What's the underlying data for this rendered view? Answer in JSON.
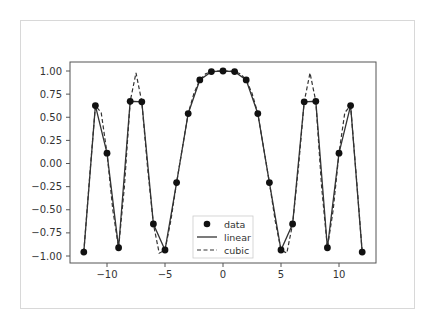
{
  "chart_data": {
    "type": "line",
    "title": "",
    "xlabel": "",
    "ylabel": "",
    "xlim": [
      -13.2,
      13.2
    ],
    "ylim": [
      -1.1,
      1.1
    ],
    "grid": false,
    "legend_position": "lower center",
    "x": [
      -12,
      -11,
      -10,
      -9,
      -8,
      -7,
      -6,
      -5,
      -4,
      -3,
      -2,
      -1,
      0,
      1,
      2,
      3,
      4,
      5,
      6,
      7,
      8,
      9,
      10,
      11,
      12
    ],
    "series": [
      {
        "name": "data",
        "style": "markers",
        "color": "#111111",
        "values": [
          -0.958,
          0.626,
          0.112,
          -0.911,
          0.672,
          0.667,
          -0.654,
          -0.935,
          -0.206,
          0.54,
          0.903,
          0.994,
          1.0,
          0.994,
          0.903,
          0.54,
          -0.206,
          -0.935,
          -0.654,
          0.667,
          0.672,
          -0.911,
          0.112,
          0.626,
          -0.958
        ]
      },
      {
        "name": "linear",
        "style": "solid",
        "color": "#333333",
        "values": [
          -0.958,
          0.626,
          0.112,
          -0.911,
          0.672,
          0.667,
          -0.654,
          -0.935,
          -0.206,
          0.54,
          0.903,
          0.994,
          1.0,
          0.994,
          0.903,
          0.54,
          -0.206,
          -0.935,
          -0.654,
          0.667,
          0.672,
          -0.911,
          0.112,
          0.626,
          -0.958
        ]
      },
      {
        "name": "cubic",
        "style": "dashed",
        "color": "#333333",
        "x": [
          -12,
          -11.5,
          -11,
          -10.5,
          -10,
          -9.5,
          -9,
          -8.5,
          -8,
          -7.5,
          -7,
          -6.5,
          -6,
          -5.5,
          -5,
          -4.5,
          -4,
          -3.5,
          -3,
          -2.5,
          -2,
          -1.5,
          -1,
          -0.5,
          0,
          0.5,
          1,
          1.5,
          2,
          2.5,
          3,
          3.5,
          4,
          4.5,
          5,
          5.5,
          6,
          6.5,
          7,
          7.5,
          8,
          8.5,
          9,
          9.5,
          10,
          10.5,
          11,
          11.5,
          12
        ],
        "values": [
          -0.958,
          -0.15,
          0.626,
          0.55,
          0.112,
          -0.5,
          -0.911,
          -0.25,
          0.672,
          0.98,
          0.667,
          -0.05,
          -0.654,
          -0.97,
          -0.935,
          -0.62,
          -0.206,
          0.17,
          0.54,
          0.76,
          0.903,
          0.97,
          0.994,
          1.0,
          1.0,
          1.0,
          0.994,
          0.97,
          0.903,
          0.76,
          0.54,
          0.17,
          -0.206,
          -0.62,
          -0.935,
          -0.97,
          -0.654,
          -0.05,
          0.667,
          0.98,
          0.672,
          -0.25,
          -0.911,
          -0.5,
          0.112,
          0.55,
          0.626,
          -0.15,
          -0.958
        ]
      }
    ],
    "xticks": [
      -10,
      -5,
      0,
      5,
      10
    ],
    "xtick_labels": [
      "−10",
      "−5",
      "0",
      "5",
      "10"
    ],
    "yticks": [
      1.0,
      0.75,
      0.5,
      0.25,
      0.0,
      -0.25,
      -0.5,
      -0.75,
      -1.0
    ],
    "ytick_labels": [
      "1.00",
      "0.75",
      "0.50",
      "0.25",
      "0.00",
      "−0.25",
      "−0.50",
      "−0.75",
      "−1.00"
    ],
    "legend": [
      "data",
      "linear",
      "cubic"
    ]
  }
}
